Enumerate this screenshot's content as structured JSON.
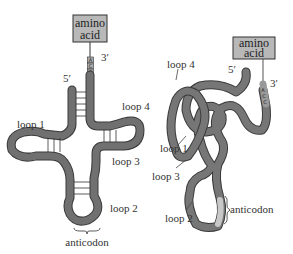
{
  "figure": {
    "left_diagram": {
      "title": "cloverleaf tRNA",
      "box": {
        "line1": "amino",
        "line2": "acid"
      },
      "prime3": "3′",
      "prime5": "5′",
      "acceptor_bases": [
        "A",
        "C",
        "C"
      ],
      "loop1": "loop 1",
      "loop2": "loop 2",
      "loop3": "loop 3",
      "loop4": "loop 4",
      "anticodon": "anticodon"
    },
    "right_diagram": {
      "title": "3D folded tRNA",
      "box": {
        "line1": "amino",
        "line2": "acid"
      },
      "prime3": "3′",
      "prime5": "5′",
      "acceptor_bases": [
        "A",
        "C",
        "C"
      ],
      "loop1": "loop 1",
      "loop2": "loop 2",
      "loop3": "loop 3",
      "loop4": "loop 4",
      "anticodon": "anticodon"
    },
    "colors": {
      "strand": "#6e6e6e",
      "strand_edge": "#3a3a3a",
      "box_fill": "#b8b8b8",
      "anticodon": "#c8c8c8",
      "text": "#333333"
    }
  }
}
